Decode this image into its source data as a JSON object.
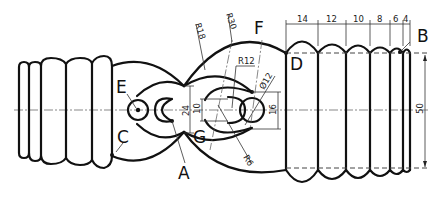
{
  "drawing": {
    "title": "Bellows / gear technical drawing",
    "point_labels": {
      "A": "A",
      "B": "B",
      "C": "C",
      "D": "D",
      "E": "E",
      "F": "F",
      "G": "G"
    },
    "radius_labels": {
      "r18": "R18",
      "r30": "R30",
      "r12": "R12",
      "r6": "R6",
      "dia12": "Ø12"
    },
    "dimensions": {
      "top_chain": [
        "14",
        "12",
        "10",
        "8",
        "6",
        "4"
      ],
      "height_24": "24",
      "height_10": "10",
      "height_16": "16",
      "height_50": "50"
    },
    "colors": {
      "line": "#111111",
      "background": "#ffffff"
    }
  }
}
